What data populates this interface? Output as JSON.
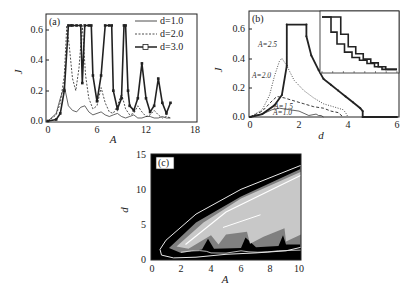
{
  "chart_data": [
    {
      "panel": "(a)",
      "type": "line",
      "xlabel": "A",
      "ylabel": "J",
      "xlim": [
        0,
        18
      ],
      "ylim": [
        0,
        0.65
      ],
      "xticks": [
        "0",
        "6",
        "12",
        "18"
      ],
      "yticks": [
        "0.0",
        "0.2",
        "0.4",
        "0.6"
      ],
      "legend_position": "upper right",
      "series": [
        {
          "name": "d=1.0",
          "style": "solid thin",
          "x": [
            0,
            1,
            1.5,
            2,
            2.5,
            3,
            3.5,
            4,
            4.5,
            5,
            5.5,
            6,
            6.5,
            7,
            7.5,
            8,
            8.5,
            9,
            9.5,
            10,
            10.5,
            11,
            11.5,
            12,
            12.5,
            13,
            13.5,
            14,
            14.5,
            15
          ],
          "y": [
            0,
            0.05,
            0.15,
            0.23,
            0.1,
            0.07,
            0.06,
            0.09,
            0.1,
            0.06,
            0.04,
            0.05,
            0.06,
            0.04,
            0.03,
            0.04,
            0.05,
            0.03,
            0.02,
            0.03,
            0.04,
            0.02,
            0.02,
            0.03,
            0.03,
            0.02,
            0.02,
            0.03,
            0.02,
            0.02
          ]
        },
        {
          "name": "d=2.0",
          "style": "dashed",
          "x": [
            0,
            1,
            1.5,
            2,
            2.3,
            2.6,
            3,
            3.4,
            3.8,
            4.2,
            4.6,
            5,
            5.5,
            6,
            6.5,
            7,
            7.5,
            8,
            8.5,
            9,
            9.5,
            10,
            10.5,
            11,
            11.5,
            12,
            12.5,
            13,
            13.5,
            14,
            14.5,
            15
          ],
          "y": [
            0,
            0.04,
            0.12,
            0.3,
            0.63,
            0.5,
            0.28,
            0.2,
            0.35,
            0.63,
            0.3,
            0.15,
            0.08,
            0.1,
            0.22,
            0.12,
            0.06,
            0.05,
            0.1,
            0.18,
            0.08,
            0.04,
            0.05,
            0.1,
            0.06,
            0.03,
            0.04,
            0.07,
            0.04,
            0.02,
            0.03,
            0.02
          ]
        },
        {
          "name": "d=3.0",
          "style": "solid thick with squares",
          "x": [
            0,
            1,
            1.5,
            2,
            2.5,
            2.8,
            3,
            3.5,
            4,
            4.2,
            4.5,
            5,
            5.3,
            5.5,
            6,
            6.5,
            7,
            7.5,
            7.8,
            8,
            8.5,
            9,
            9.3,
            9.5,
            9.8,
            10,
            10.5,
            11,
            11.5,
            12,
            12.5,
            13,
            13.5,
            14,
            14.5,
            15
          ],
          "y": [
            0,
            0.01,
            0.05,
            0.2,
            0.63,
            0.63,
            0.63,
            0.63,
            0.63,
            0.25,
            0.63,
            0.63,
            0.63,
            0.3,
            0.13,
            0.3,
            0.63,
            0.63,
            0.63,
            0.2,
            0.08,
            0.15,
            0.63,
            0.63,
            0.2,
            0.1,
            0.07,
            0.15,
            0.38,
            0.15,
            0.06,
            0.1,
            0.28,
            0.12,
            0.05,
            0.12
          ]
        }
      ]
    },
    {
      "panel": "(b)",
      "type": "line",
      "xlabel": "d",
      "ylabel": "J",
      "xlim": [
        0,
        6
      ],
      "ylim": [
        0,
        0.65
      ],
      "xticks": [
        "0",
        "2",
        "4",
        "6"
      ],
      "yticks": [
        "0.0",
        "0.2",
        "0.4",
        "0.6"
      ],
      "annotations": [
        "A=2.5",
        "A=2.0",
        "A=1.5",
        "A=1.0"
      ],
      "series": [
        {
          "name": "A=2.5",
          "style": "solid thick with dots stepped",
          "x": [
            0,
            0.5,
            1,
            1.3,
            1.5,
            1.5,
            2.3,
            2.3,
            2.5,
            2.8,
            3,
            3.3,
            3.6,
            3.9,
            4.2,
            4.5,
            4.6,
            4.6,
            6
          ],
          "y": [
            0,
            0.02,
            0.08,
            0.15,
            0.35,
            0.63,
            0.63,
            0.55,
            0.42,
            0.32,
            0.26,
            0.22,
            0.18,
            0.14,
            0.1,
            0.06,
            0.04,
            0,
            0
          ]
        },
        {
          "name": "A=2.0",
          "style": "dotted",
          "x": [
            0,
            0.5,
            0.8,
            1.0,
            1.2,
            1.3,
            1.5,
            1.8,
            2.2,
            2.6,
            3.0,
            3.4,
            3.8,
            3.9,
            4.0
          ],
          "y": [
            0,
            0.05,
            0.15,
            0.28,
            0.38,
            0.4,
            0.35,
            0.25,
            0.18,
            0.13,
            0.09,
            0.07,
            0.05,
            0.03,
            0
          ]
        },
        {
          "name": "A=1.5",
          "style": "dashed",
          "x": [
            0,
            0.5,
            0.9,
            1.1,
            1.4,
            1.8,
            2.2,
            2.6,
            3.0,
            3.3,
            3.6,
            3.8
          ],
          "y": [
            0,
            0.04,
            0.11,
            0.14,
            0.13,
            0.11,
            0.09,
            0.07,
            0.06,
            0.04,
            0.03,
            0
          ]
        },
        {
          "name": "A=1.0",
          "style": "solid thin",
          "x": [
            0,
            0.5,
            0.9,
            1.2,
            1.6,
            2.0,
            2.4,
            2.7,
            2.8,
            2.9,
            3.0
          ],
          "y": [
            0,
            0.02,
            0.05,
            0.06,
            0.05,
            0.04,
            0.01,
            0.02,
            0.01,
            0.01,
            0
          ]
        }
      ],
      "inset": {
        "description": "stepped decaying J vs d curves (two curves)",
        "series": [
          {
            "name": "inner",
            "x": [
              0,
              0.07,
              0.12,
              0.2,
              0.3,
              0.4,
              0.5,
              0.6,
              0.7,
              0.8,
              1.0
            ],
            "y": [
              1,
              1,
              0.72,
              0.5,
              0.35,
              0.25,
              0.2,
              0.14,
              0.08,
              0.03,
              0.03
            ]
          },
          {
            "name": "outer",
            "x": [
              0,
              0.17,
              0.25,
              0.35,
              0.45,
              0.55,
              0.65,
              0.75,
              0.85,
              1.0
            ],
            "y": [
              1,
              1,
              0.68,
              0.45,
              0.32,
              0.22,
              0.15,
              0.08,
              0.03,
              0.03
            ]
          }
        ]
      }
    },
    {
      "panel": "(c)",
      "type": "heatmap",
      "xlabel": "A",
      "ylabel": "d",
      "xlim": [
        0,
        10
      ],
      "ylim": [
        0,
        15
      ],
      "xticks": [
        "0",
        "2",
        "4",
        "6",
        "8",
        "10"
      ],
      "yticks": [
        "0",
        "5",
        "10",
        "15"
      ],
      "colors": {
        "background": "#000000",
        "band_light": "#c8c8c8",
        "band_mid": "#808080",
        "contour": "#e8e8e8"
      },
      "description": "Black background with light-gray wedge region rising from A≈1,d≈1 to A=10,d≈13; scalloped lower edges at A≈4,6.5,9 with outline contours"
    }
  ],
  "labels": {
    "a": {
      "panel": "(a)",
      "xlabel": "A",
      "ylabel": "J",
      "xticks": [
        "0",
        "6",
        "12",
        "18"
      ],
      "yticks": [
        "0.0",
        "0.2",
        "0.4",
        "0.6"
      ],
      "legend": [
        "d=1.0",
        "d=2.0",
        "d=3.0"
      ]
    },
    "b": {
      "panel": "(b)",
      "xlabel": "d",
      "ylabel": "J",
      "xticks": [
        "0",
        "2",
        "4",
        "6"
      ],
      "yticks": [
        "0.0",
        "0.2",
        "0.4",
        "0.6"
      ],
      "ann": [
        "A=2.5",
        "A=2.0",
        "A=1.5",
        "A=1.0"
      ]
    },
    "c": {
      "panel": "(c)",
      "xlabel": "A",
      "ylabel": "d",
      "xticks": [
        "0",
        "2",
        "4",
        "6",
        "8",
        "10"
      ],
      "yticks": [
        "0",
        "5",
        "10",
        "15"
      ]
    }
  }
}
